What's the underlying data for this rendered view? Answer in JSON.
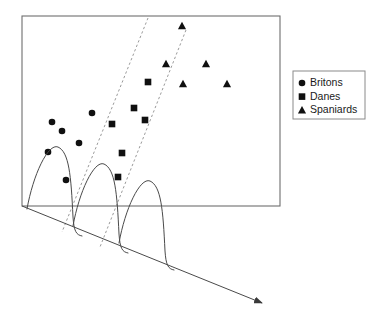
{
  "figure": {
    "title": "",
    "colors": {
      "marker": "#101010",
      "frame": "#6e6e6e",
      "dashed_boundary": "#9a9a9a",
      "curve": "#4a4a4a",
      "axis": "#4a4a4a",
      "legend_border": "#8a8a8a",
      "background": "#ffffff",
      "text": "#1a1a1a"
    }
  },
  "legend": {
    "x": 293,
    "y": 71,
    "width": 72,
    "height": 48,
    "entries": [
      {
        "label": "Britons",
        "marker": "circle",
        "icon": "circle-marker-icon"
      },
      {
        "label": "Danes",
        "marker": "square",
        "icon": "square-marker-icon"
      },
      {
        "label": "Spaniards",
        "marker": "triangle",
        "icon": "triangle-marker-icon"
      }
    ]
  },
  "plot_frame": {
    "x": 22,
    "y": 16,
    "width": 258,
    "height": 190
  },
  "chart_data": {
    "type": "scatter",
    "title": "",
    "xlabel": "",
    "ylabel": "",
    "xlim": [
      22,
      280
    ],
    "ylim": [
      16,
      206
    ],
    "grid": false,
    "legend_position": "right-outside",
    "series": [
      {
        "name": "Britons",
        "marker": "circle",
        "color": "#101010",
        "points": [
          [
            48,
            152
          ],
          [
            62,
            131
          ],
          [
            79,
            143
          ],
          [
            92,
            113
          ],
          [
            66,
            180
          ],
          [
            52,
            122
          ]
        ]
      },
      {
        "name": "Danes",
        "marker": "square",
        "color": "#101010",
        "points": [
          [
            112,
            124
          ],
          [
            122,
            153
          ],
          [
            134,
            108
          ],
          [
            145,
            120
          ],
          [
            148,
            82
          ],
          [
            118,
            177
          ]
        ]
      },
      {
        "name": "Spaniards",
        "marker": "triangle",
        "color": "#101010",
        "points": [
          [
            166,
            64
          ],
          [
            182,
            26
          ],
          [
            183,
            84
          ],
          [
            206,
            64
          ],
          [
            227,
            84
          ]
        ]
      }
    ],
    "boundaries": [
      {
        "name": "boundary-1",
        "style": "dashed",
        "x1": 148,
        "y1": 18,
        "x2": 62,
        "y2": 232
      },
      {
        "name": "boundary-2",
        "style": "dashed",
        "x1": 186,
        "y1": 30,
        "x2": 100,
        "y2": 247
      }
    ],
    "density_curves": [
      {
        "name": "density-curve-britons",
        "peak_x": 60,
        "base_x": 27,
        "base_y": 209
      },
      {
        "name": "density-curve-danes",
        "peak_x": 106,
        "base_x": 73,
        "base_y": 226
      },
      {
        "name": "density-curve-spaniards",
        "peak_x": 152,
        "base_x": 119,
        "base_y": 243
      }
    ],
    "projection_axis": {
      "name": "discriminant-axis",
      "x1": 22,
      "y1": 206,
      "x2": 262,
      "y2": 303,
      "arrow": true
    }
  }
}
